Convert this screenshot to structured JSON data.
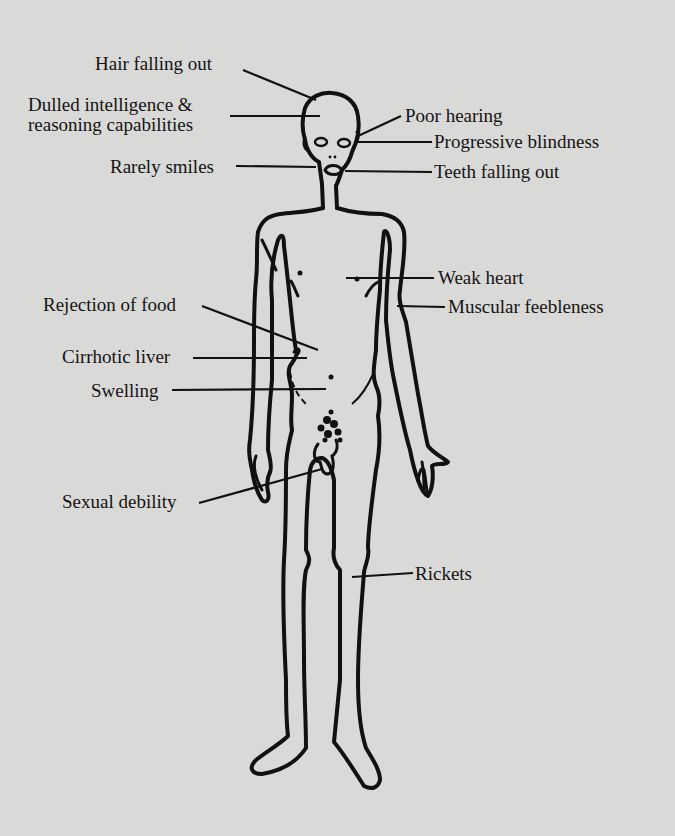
{
  "diagram": {
    "background_color": "#d9d9d7",
    "ink_color": "#141414",
    "labels_left": [
      {
        "id": "hair",
        "text": "Hair falling out"
      },
      {
        "id": "intelligence_1",
        "text": "Dulled intelligence &"
      },
      {
        "id": "intelligence_2",
        "text": "reasoning capabilities"
      },
      {
        "id": "smiles",
        "text": "Rarely smiles"
      },
      {
        "id": "food",
        "text": "Rejection of food"
      },
      {
        "id": "liver",
        "text": "Cirrhotic liver"
      },
      {
        "id": "swelling",
        "text": "Swelling"
      },
      {
        "id": "sexual",
        "text": "Sexual debility"
      }
    ],
    "labels_right": [
      {
        "id": "hearing",
        "text": "Poor hearing"
      },
      {
        "id": "blindness",
        "text": "Progressive blindness"
      },
      {
        "id": "teeth",
        "text": "Teeth falling out"
      },
      {
        "id": "heart",
        "text": "Weak heart"
      },
      {
        "id": "muscle",
        "text": "Muscular feebleness"
      },
      {
        "id": "rickets",
        "text": "Rickets"
      }
    ]
  }
}
